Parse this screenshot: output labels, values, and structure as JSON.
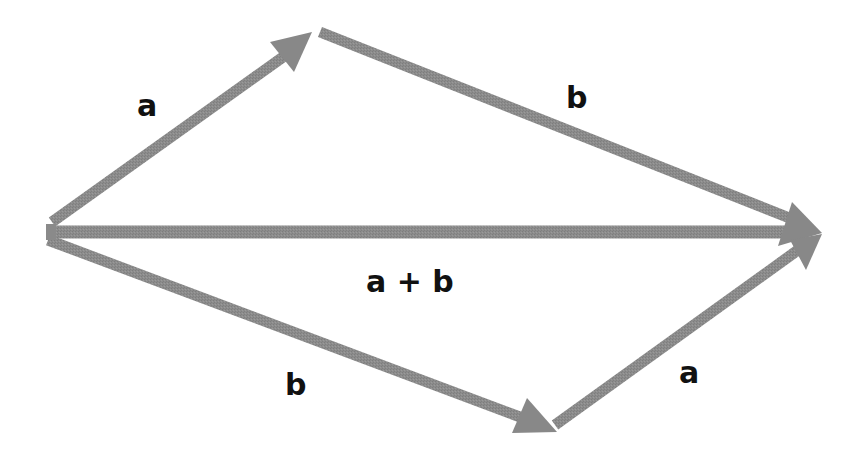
{
  "diagram": {
    "colors": {
      "arrow": "#8a8a8a",
      "label": "#111111",
      "background": "#ffffff"
    },
    "labels": {
      "top_a": "a",
      "top_b": "b",
      "sum": "a + b",
      "bottom_b": "b",
      "bottom_a": "a"
    },
    "vectors": [
      {
        "id": "top-a",
        "label": "a",
        "from": [
          48,
          222
        ],
        "to": [
          312,
          32
        ],
        "arrowhead": true
      },
      {
        "id": "top-b",
        "label": "b",
        "from": [
          320,
          32
        ],
        "to": [
          820,
          232
        ],
        "arrowhead": true
      },
      {
        "id": "sum",
        "label": "a + b",
        "from": [
          48,
          232
        ],
        "to": [
          820,
          232
        ],
        "arrowhead": true
      },
      {
        "id": "bottom-b",
        "label": "b",
        "from": [
          48,
          240
        ],
        "to": [
          557,
          432
        ],
        "arrowhead": true
      },
      {
        "id": "bottom-a",
        "label": "a",
        "from": [
          555,
          425
        ],
        "to": [
          820,
          232
        ],
        "arrowhead": true
      }
    ]
  }
}
